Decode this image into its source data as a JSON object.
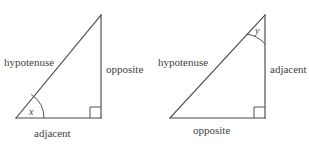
{
  "figure": {
    "background_color": "#ffffff",
    "stroke_color": "#4a4a4a",
    "text_color": "#3f3f3f",
    "triangles": [
      {
        "id": "left-triangle",
        "angle_label": "x",
        "angle_vertex": "bottom-left",
        "right_angle_vertex": "bottom-right",
        "labels": {
          "hypotenuse": "hypotenuse",
          "opposite": "opposite",
          "adjacent": "adjacent"
        }
      },
      {
        "id": "right-triangle",
        "angle_label": "y",
        "angle_vertex": "top",
        "right_angle_vertex": "bottom-right",
        "labels": {
          "hypotenuse": "hypotenuse",
          "opposite": "opposite",
          "adjacent": "adjacent"
        }
      }
    ]
  }
}
